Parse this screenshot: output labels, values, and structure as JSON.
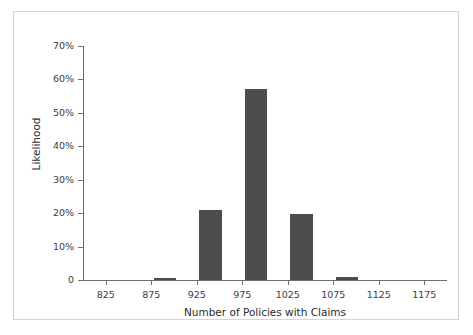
{
  "chart_data": {
    "type": "bar",
    "title": "",
    "subtitle": "",
    "xlabel": "Number of Policies with Claims",
    "ylabel": "Likelihood",
    "xlim": [
      800,
      1200
    ],
    "ylim": [
      0,
      70
    ],
    "grid": false,
    "legend": "none",
    "bar_color": "#4d4d4d",
    "x_ticks": [
      825,
      875,
      925,
      975,
      1025,
      1075,
      1125,
      1175
    ],
    "x_tick_labels": [
      "825",
      "875",
      "925",
      "975",
      "1025",
      "1075",
      "1125",
      "1175"
    ],
    "y_ticks": [
      0,
      10,
      20,
      30,
      40,
      50,
      60,
      70
    ],
    "y_tick_labels": [
      "0",
      "10%",
      "20%",
      "30%",
      "40%",
      "50%",
      "60%",
      "70%"
    ],
    "bar_width": 25,
    "x": [
      890,
      940,
      990,
      1040,
      1090
    ],
    "values": [
      0.6,
      21.0,
      57.0,
      19.8,
      0.8
    ],
    "bars": [
      {
        "x": 890,
        "value": 0.6
      },
      {
        "x": 940,
        "value": 21.0
      },
      {
        "x": 990,
        "value": 57.0
      },
      {
        "x": 1040,
        "value": 19.8
      },
      {
        "x": 1090,
        "value": 0.8
      }
    ]
  },
  "figure": {
    "border_color": "#d4d4d4",
    "background": "#ffffff"
  }
}
